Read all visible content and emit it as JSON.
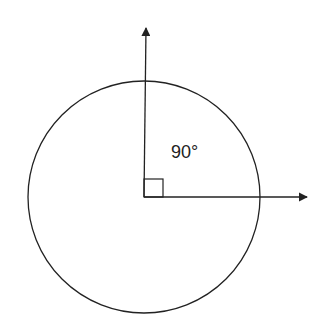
{
  "diagram": {
    "angle_label": "90°",
    "colors": {
      "stroke": "#222222",
      "background": "#ffffff"
    },
    "circle": {
      "cx": 144,
      "cy": 197,
      "r": 116
    },
    "rays": [
      {
        "name": "vertical-ray",
        "direction": "up"
      },
      {
        "name": "horizontal-ray",
        "direction": "right"
      }
    ],
    "right_angle_marker": true
  }
}
